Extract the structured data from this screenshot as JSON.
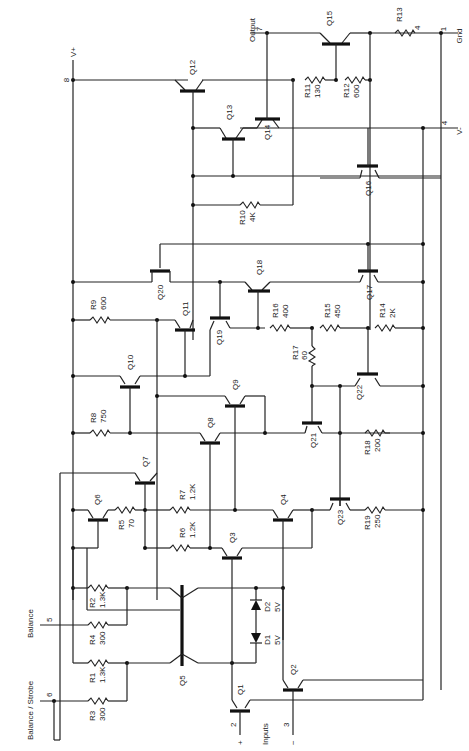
{
  "schematic": {
    "orientation": "rotated 90° clockwise",
    "pins": {
      "vplus": {
        "number": "8",
        "label": "V+"
      },
      "output": {
        "number": "7",
        "label": "Output"
      },
      "gnd": {
        "number": "1",
        "label": "Gnd"
      },
      "vminus": {
        "number": "4",
        "label": "V-"
      },
      "balance": {
        "number": "5",
        "label": "Balance"
      },
      "balance_strobe": {
        "number": "6",
        "label": "Balance / Strobe"
      },
      "input_plus": {
        "number": "2",
        "sign": "+"
      },
      "input_minus": {
        "number": "3",
        "sign": "−"
      },
      "inputs_label": "Inputs"
    },
    "transistors": {
      "q1": "Q1",
      "q2": "Q2",
      "q3": "Q3",
      "q4": "Q4",
      "q5": "Q5",
      "q6": "Q6",
      "q7": "Q7",
      "q8": "Q8",
      "q9": "Q9",
      "q10": "Q10",
      "q11": "Q11",
      "q12": "Q12",
      "q13": "Q13",
      "q14": "Q14",
      "q15": "Q15",
      "q16": "Q16",
      "q17": "Q17",
      "q18": "Q18",
      "q19": "Q19",
      "q20": "Q20",
      "q21": "Q21",
      "q22": "Q22",
      "q23": "Q23"
    },
    "resistors": {
      "r1": {
        "name": "R1",
        "value": "1.3K"
      },
      "r2": {
        "name": "R2",
        "value": "1.3K"
      },
      "r3": {
        "name": "R3",
        "value": "300"
      },
      "r4": {
        "name": "R4",
        "value": "300"
      },
      "r5": {
        "name": "R5",
        "value": "70"
      },
      "r6": {
        "name": "R6",
        "value": "1.2K"
      },
      "r7": {
        "name": "R7",
        "value": "1.2K"
      },
      "r8": {
        "name": "R8",
        "value": "750"
      },
      "r9": {
        "name": "R9",
        "value": "600"
      },
      "r10": {
        "name": "R10",
        "value": "4K"
      },
      "r11": {
        "name": "R11",
        "value": "130"
      },
      "r12": {
        "name": "R12",
        "value": "600"
      },
      "r13": {
        "name": "R13",
        "value": "4"
      },
      "r14": {
        "name": "R14",
        "value": "2K"
      },
      "r15": {
        "name": "R15",
        "value": "450"
      },
      "r16": {
        "name": "R16",
        "value": "400"
      },
      "r17": {
        "name": "R17",
        "value": "60"
      },
      "r18": {
        "name": "R18",
        "value": "200"
      },
      "r19": {
        "name": "R19",
        "value": "250"
      }
    },
    "diodes": {
      "d1": {
        "name": "D1",
        "value": "5V"
      },
      "d2": {
        "name": "D2",
        "value": "5V"
      }
    }
  }
}
